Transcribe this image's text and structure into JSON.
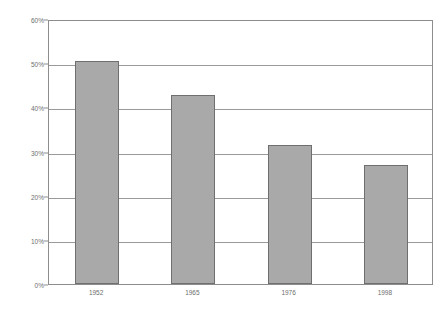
{
  "chart_data": {
    "type": "bar",
    "title": "",
    "subtitle": "",
    "xlabel": "",
    "ylabel": "\"그렇다\"고 대답한 사람의 비율",
    "categories": [
      "1952",
      "1965",
      "1976",
      "1998"
    ],
    "values": [
      50.5,
      42.8,
      31.5,
      27.0
    ],
    "ylim": [
      0,
      60
    ],
    "ytick_values": [
      0,
      10,
      20,
      30,
      40,
      50,
      60
    ],
    "ytick_labels": [
      "0%",
      "10%",
      "20%",
      "30%",
      "40%",
      "50%",
      "60%"
    ],
    "grid": true,
    "grid_axis": "y",
    "legend": false,
    "legend_position": "none",
    "series": [
      {
        "name": "",
        "values": [
          50.5,
          42.8,
          31.5,
          27.0
        ]
      }
    ],
    "colors": {
      "bar_fill": "#a9a9a9",
      "bar_border": "#6f6f6f",
      "gridline": "#9a9a9a",
      "axis": "#8d8d8d",
      "text": "#6e6e6e",
      "background": "#ffffff"
    }
  }
}
